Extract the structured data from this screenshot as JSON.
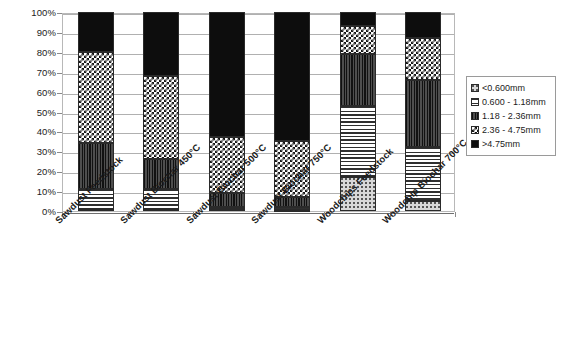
{
  "chart_data": {
    "type": "bar",
    "subtype": "stacked-percent",
    "title": "",
    "xlabel": "",
    "ylabel": "",
    "ylim": [
      0,
      100
    ],
    "y_unit": "%",
    "grid": true,
    "legend_position": "right",
    "categories": [
      "Sawdust Feedstock",
      "Sawdust Biochar 450°C",
      "Sawdust Biochar 500°C",
      "Sawdust Biochar 750°C",
      "Woodchips Feedstock",
      "Woodchip Biochar 700°C"
    ],
    "y_ticks": [
      "0%",
      "10%",
      "20%",
      "30%",
      "40%",
      "50%",
      "60%",
      "70%",
      "80%",
      "90%",
      "100%"
    ],
    "y_tick_values": [
      0,
      10,
      20,
      30,
      40,
      50,
      60,
      70,
      80,
      90,
      100
    ],
    "series": [
      {
        "name": "<0.600mm",
        "pattern": "fine-speckle",
        "color": "#d8d8d8",
        "values": [
          20,
          32,
          63,
          65,
          7,
          13
        ]
      },
      {
        "name": "0.600 - 1.18mm",
        "pattern": "horizontal-lines",
        "color": "#ffffff",
        "values": [
          46,
          42,
          28,
          28,
          14,
          21
        ]
      },
      {
        "name": "1.18 - 2.36mm",
        "pattern": "vertical-lines-dark",
        "color": "#3a3a3a",
        "values": [
          23,
          15,
          7,
          5,
          26,
          34
        ]
      },
      {
        "name": "2.36 - 4.75mm",
        "pattern": "checkerboard",
        "color": "#ffffff",
        "values": [
          10,
          10,
          1,
          1.5,
          36,
          27
        ]
      },
      {
        "name": ">4.75mm",
        "pattern": "solid-black",
        "color": "#0d0d0d",
        "values": [
          1,
          1,
          1,
          0.5,
          17,
          5
        ]
      }
    ],
    "stack_boundaries": [
      [
        0,
        1,
        11,
        34,
        80,
        100
      ],
      [
        0,
        1,
        11,
        26,
        68,
        100
      ],
      [
        0,
        1,
        2,
        9,
        37,
        100
      ],
      [
        0,
        0.5,
        2,
        7,
        35,
        100
      ],
      [
        0,
        17,
        53,
        79,
        93,
        100
      ],
      [
        0,
        5,
        32,
        66,
        87,
        100
      ]
    ]
  },
  "legend": {
    "items": [
      {
        "label": "<0.600mm"
      },
      {
        "label": "0.600 - 1.18mm"
      },
      {
        "label": "1.18 - 2.36mm"
      },
      {
        "label": "2.36 - 4.75mm"
      },
      {
        "label": ">4.75mm"
      }
    ]
  }
}
